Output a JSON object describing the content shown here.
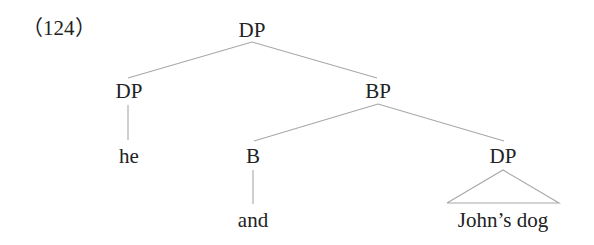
{
  "example_number": "（124）",
  "tree": {
    "root": {
      "label": "DP"
    },
    "left_dp": {
      "label": "DP",
      "terminal": "he"
    },
    "bp": {
      "label": "BP"
    },
    "head_b": {
      "label": "B",
      "terminal": "and"
    },
    "right_dp": {
      "label": "DP",
      "terminal": "John’s dog",
      "triangle": true
    }
  },
  "colors": {
    "text": "#222222",
    "branch": "#a8a8a8",
    "background": "#ffffff"
  }
}
